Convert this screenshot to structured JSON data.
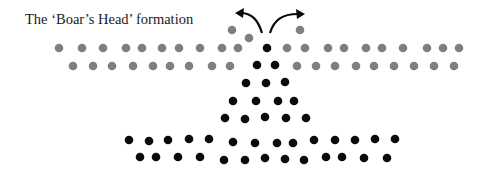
{
  "title": "The ‘Boar’s Head’ formation",
  "colors": {
    "grey": "#7f7f7f",
    "black": "#0a0a0a",
    "arrow": "#0a0a0a"
  },
  "dot_radius": 4.3,
  "grey_dots": [
    [
      59,
      48
    ],
    [
      82,
      48
    ],
    [
      103,
      48
    ],
    [
      126,
      48
    ],
    [
      142,
      48
    ],
    [
      162,
      48
    ],
    [
      179,
      48
    ],
    [
      200,
      48
    ],
    [
      222,
      48
    ],
    [
      238,
      48
    ],
    [
      287,
      48
    ],
    [
      305,
      48
    ],
    [
      328,
      48
    ],
    [
      344,
      48
    ],
    [
      366,
      48
    ],
    [
      382,
      48
    ],
    [
      403,
      48
    ],
    [
      427,
      48
    ],
    [
      443,
      48
    ],
    [
      459,
      48
    ],
    [
      73,
      66
    ],
    [
      93,
      66
    ],
    [
      112,
      66
    ],
    [
      133,
      66
    ],
    [
      153,
      66
    ],
    [
      170,
      66
    ],
    [
      189,
      66
    ],
    [
      212,
      66
    ],
    [
      230,
      66
    ],
    [
      297,
      66
    ],
    [
      316,
      66
    ],
    [
      335,
      66
    ],
    [
      356,
      66
    ],
    [
      374,
      66
    ],
    [
      394,
      66
    ],
    [
      414,
      66
    ],
    [
      434,
      66
    ],
    [
      454,
      66
    ],
    [
      232,
      30
    ],
    [
      249,
      38
    ],
    [
      300,
      30
    ]
  ],
  "black_dots": [
    [
      267,
      48
    ],
    [
      257,
      65
    ],
    [
      275,
      65
    ],
    [
      246,
      83
    ],
    [
      266,
      83
    ],
    [
      285,
      82
    ],
    [
      233,
      101
    ],
    [
      256,
      101
    ],
    [
      278,
      101
    ],
    [
      294,
      101
    ],
    [
      225,
      118
    ],
    [
      245,
      119
    ],
    [
      265,
      117
    ],
    [
      286,
      118
    ],
    [
      306,
      118
    ],
    [
      129,
      140
    ],
    [
      149,
      141
    ],
    [
      168,
      140
    ],
    [
      189,
      139
    ],
    [
      209,
      139
    ],
    [
      233,
      142
    ],
    [
      255,
      143
    ],
    [
      277,
      143
    ],
    [
      293,
      143
    ],
    [
      314,
      140
    ],
    [
      335,
      140
    ],
    [
      355,
      140
    ],
    [
      375,
      139
    ],
    [
      395,
      139
    ],
    [
      140,
      157
    ],
    [
      156,
      157
    ],
    [
      178,
      157
    ],
    [
      200,
      157
    ],
    [
      224,
      160
    ],
    [
      245,
      160
    ],
    [
      265,
      158
    ],
    [
      285,
      159
    ],
    [
      304,
      160
    ],
    [
      326,
      157
    ],
    [
      342,
      157
    ],
    [
      364,
      158
    ],
    [
      387,
      158
    ]
  ],
  "arrows": [
    {
      "name": "left-arrow",
      "path": "M262,33 C258,20 252,13 240,13",
      "head": [
        238,
        13
      ],
      "dir": "left"
    },
    {
      "name": "right-arrow",
      "path": "M270,33 C274,20 282,14 298,14",
      "head": [
        302,
        14
      ],
      "dir": "right"
    }
  ]
}
